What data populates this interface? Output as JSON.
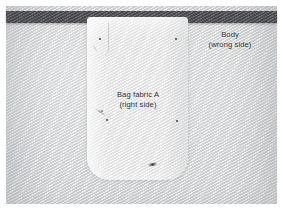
{
  "photo": {
    "kind": "sewing-instruction-photograph",
    "subject": "Bag fabric panel pinned to body fabric",
    "width": 283,
    "height": 215
  },
  "labels": {
    "body": {
      "line1": "Body",
      "line2": "(wrong side)"
    },
    "bag_fabric": {
      "line1": "Bag fabric A",
      "line2": "(right side)"
    }
  },
  "colors": {
    "photo_border": "#ffffff",
    "body_fabric": "#d9dadb",
    "dark_band": "#56565a",
    "bag_panel": "#ededec",
    "label_text": "#2c2d2f",
    "pin_mark": "#3b3c3e"
  },
  "elements": {
    "dark_band_name": "dark trim band",
    "body_fabric_name": "body fabric background",
    "bag_panel_name": "bag fabric A panel",
    "pin_marks_count": 6
  }
}
